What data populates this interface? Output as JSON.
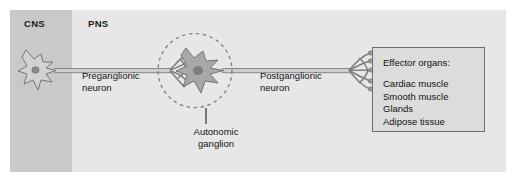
{
  "figure": {
    "regions": [
      {
        "key": "cns",
        "label": "CNS"
      },
      {
        "key": "pns",
        "label": "PNS"
      }
    ],
    "labels": {
      "preganglionic": "Preganglionic\nneuron",
      "postganglionic": "Postganglionic\nneuron",
      "ganglion": "Autonomic\nganglion"
    },
    "effector_box": {
      "title": "Effector organs:",
      "items": [
        "Cardiac muscle",
        "Smooth muscle",
        "Glands",
        "Adipose tissue"
      ]
    },
    "colors": {
      "panel_background": "#e9e9e9",
      "cns_background": "#c9c9c9",
      "pns_background": "#e7e7e7",
      "effector_fill": "#dcdcdc",
      "effector_border": "#6d6d6d",
      "soma_fill_cns": "#d2d2d2",
      "soma_fill_ganglion": "#a8a8a8",
      "nucleus_fill": "#8a8a8a",
      "outline": "#6b6b6b",
      "axon_fill": "#cfcfcf",
      "text": "#111111"
    },
    "elements": {
      "cns_neuron": "star-shaped multipolar soma with nucleus in CNS region",
      "ganglion_neuron": "star-shaped postganglionic soma with nucleus inside dashed circle",
      "ganglion_circle": "dashed circle marking the autonomic ganglion",
      "preganglionic_axon": "horizontal tube from CNS soma to ganglion",
      "postganglionic_axon": "horizontal tube from ganglion to effector organs",
      "terminal_branches": "fan of axon terminals contacting the effector organ box",
      "leader_line": "vertical pointer from dashed circle to the Autonomic ganglion label"
    }
  }
}
